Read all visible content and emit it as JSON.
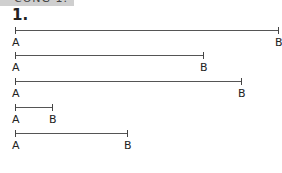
{
  "header": {
    "banner_text": "CÔNG 1.",
    "exercise_number": "1."
  },
  "segments": [
    {
      "start_label": "A",
      "end_label": "B",
      "x1": 15,
      "x2": 278,
      "y": 30
    },
    {
      "start_label": "A",
      "end_label": "B",
      "x1": 15,
      "x2": 203,
      "y": 55
    },
    {
      "start_label": "A",
      "end_label": "B",
      "x1": 15,
      "x2": 241,
      "y": 81
    },
    {
      "start_label": "A",
      "end_label": "B",
      "x1": 15,
      "x2": 52,
      "y": 107
    },
    {
      "start_label": "A",
      "end_label": "B",
      "x1": 15,
      "x2": 127,
      "y": 133
    }
  ]
}
